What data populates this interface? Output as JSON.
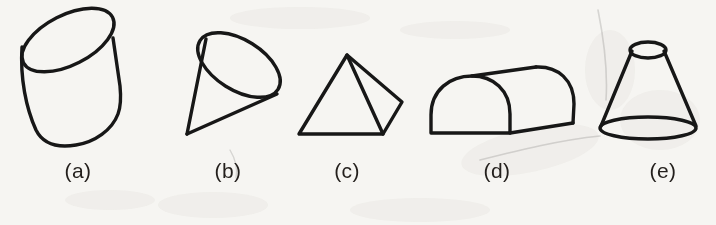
{
  "figure": {
    "background_color": "#f6f5f2",
    "ink_color": "#171717",
    "label_color": "#231f1c",
    "width": 716,
    "height": 225
  },
  "shapes": [
    {
      "key": "a",
      "label": "(a)",
      "name": "cylinder",
      "label_x": 78,
      "label_y": 178,
      "bounds": {
        "x": 20,
        "y": 12,
        "width": 103,
        "height": 135
      }
    },
    {
      "key": "b",
      "label": "(b)",
      "name": "cone",
      "label_x": 228,
      "label_y": 178,
      "bounds": {
        "x": 182,
        "y": 28,
        "width": 100,
        "height": 110
      }
    },
    {
      "key": "c",
      "label": "(c)",
      "name": "pyramid",
      "label_x": 347,
      "label_y": 178,
      "bounds": {
        "x": 296,
        "y": 52,
        "width": 108,
        "height": 85
      }
    },
    {
      "key": "d",
      "label": "(d)",
      "name": "half-cylinder",
      "label_x": 497,
      "label_y": 178,
      "bounds": {
        "x": 428,
        "y": 66,
        "width": 148,
        "height": 72
      }
    },
    {
      "key": "e",
      "label": "(e)",
      "name": "truncated-cone-frustum",
      "label_x": 663,
      "label_y": 178,
      "bounds": {
        "x": 596,
        "y": 40,
        "width": 102,
        "height": 100
      }
    }
  ]
}
